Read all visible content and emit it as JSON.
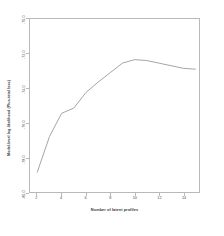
{
  "chart_data": {
    "type": "line",
    "title": "",
    "xlabel": "Number of latent profiles",
    "ylabel": "Model-level log-likelihood (Plus-total loss)",
    "x": [
      2,
      3,
      4,
      5,
      6,
      7,
      8,
      9,
      10,
      11,
      12,
      13,
      14,
      15
    ],
    "values": [
      -78.85,
      -76.8,
      -75.45,
      -75.15,
      -74.25,
      -73.65,
      -73.1,
      -72.55,
      -72.35,
      -72.4,
      -72.55,
      -72.7,
      -72.85,
      -72.9
    ],
    "series": [
      {
        "name": "log-likelihood",
        "values": [
          -78.85,
          -76.8,
          -75.45,
          -75.15,
          -74.25,
          -73.65,
          -73.1,
          -72.55,
          -72.35,
          -72.4,
          -72.55,
          -72.7,
          -72.85,
          -72.9
        ]
      }
    ],
    "xlim": [
      1.4,
      15.3
    ],
    "ylim": [
      -80.0,
      -70.0
    ],
    "xticks": [
      2,
      4,
      6,
      8,
      10,
      12,
      14
    ],
    "xtick_labels": [
      "2",
      "4",
      "6",
      "8",
      "10",
      "12",
      "14"
    ],
    "yticks": [
      -80.0,
      -78.0,
      -76.0,
      -74.0,
      -72.0,
      -70.0
    ],
    "ytick_labels": [
      "-80.0",
      "-78.0",
      "-76.0",
      "-74.0",
      "-72.0",
      "-70.0"
    ],
    "grid": false,
    "legend": "none",
    "line_color": "#9a9a9a",
    "frame_color": "#b9b9b9",
    "background_color": "#ffffff"
  }
}
